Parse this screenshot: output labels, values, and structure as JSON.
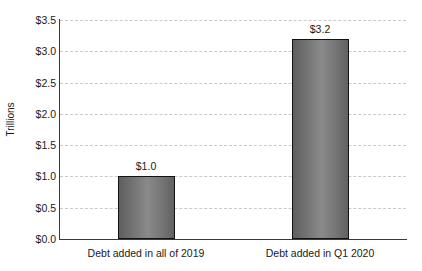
{
  "chart_data": {
    "type": "bar",
    "title": "",
    "xlabel": "",
    "ylabel": "Trillions",
    "categories": [
      "Debt added in all of 2019",
      "Debt added in Q1 2020"
    ],
    "values": [
      1.0,
      3.2
    ],
    "value_labels": [
      "$1.0",
      "$3.2"
    ],
    "ylim": [
      0.0,
      3.5
    ],
    "ytick_values": [
      0.0,
      0.5,
      1.0,
      1.5,
      2.0,
      2.5,
      3.0,
      3.5
    ],
    "ytick_labels": [
      "$0.0",
      "$0.5",
      "$1.0",
      "$1.5",
      "$2.0",
      "$2.5",
      "$3.0",
      "$3.5"
    ],
    "grid": true,
    "grid_style": "dashed",
    "legend": false,
    "colors": {
      "bar_fill_light": "#8a8a8a",
      "bar_fill_dark": "#5e5e5e",
      "bar_outline": "#121212",
      "gridline": "#c9c9c9",
      "axis": "#3a3a3a",
      "background": "#ffffff",
      "text": "#1a1a1a"
    }
  }
}
